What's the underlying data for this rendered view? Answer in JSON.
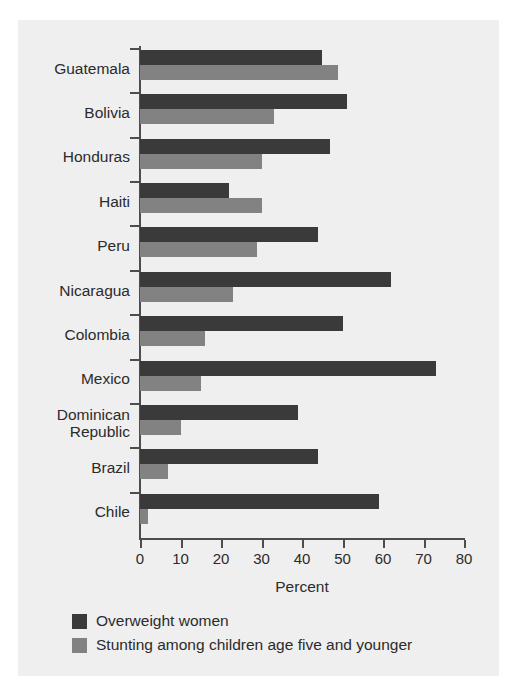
{
  "chart_data": {
    "type": "bar",
    "orientation": "horizontal",
    "title": "",
    "xlabel": "Percent",
    "ylabel": "",
    "xlim": [
      0,
      80
    ],
    "xticks": [
      0,
      10,
      20,
      30,
      40,
      50,
      60,
      70,
      80
    ],
    "grid": false,
    "legend_position": "bottom-left",
    "categories": [
      "Guatemala",
      "Bolivia",
      "Honduras",
      "Haiti",
      "Peru",
      "Nicaragua",
      "Colombia",
      "Mexico",
      "Dominican\nRepublic",
      "Brazil",
      "Chile"
    ],
    "category_labels": [
      "Guatemala",
      "Bolivia",
      "Honduras",
      "Haiti",
      "Peru",
      "Nicaragua",
      "Colombia",
      "Mexico",
      "Dominican Republic",
      "Brazil",
      "Chile"
    ],
    "series": [
      {
        "name": "Overweight women",
        "color": "#3a3a3a",
        "values": [
          45,
          51,
          47,
          22,
          44,
          62,
          50,
          73,
          39,
          44,
          59
        ]
      },
      {
        "name": "Stunting among children age five and younger",
        "color": "#828282",
        "values": [
          49,
          33,
          30,
          30,
          29,
          23,
          16,
          15,
          10,
          7,
          2
        ]
      }
    ]
  },
  "axis": {
    "x_title": "Percent",
    "tick_labels": [
      "0",
      "10",
      "20",
      "30",
      "40",
      "50",
      "60",
      "70",
      "80"
    ]
  },
  "legend": {
    "items": [
      {
        "label": "Overweight women",
        "color": "#3a3a3a"
      },
      {
        "label": "Stunting among children age five and younger",
        "color": "#828282"
      }
    ]
  },
  "colors": {
    "series_dark": "#3a3a3a",
    "series_light": "#828282",
    "panel_background": "#efefef",
    "axis": "#4d4d4d",
    "text": "#2b2b2b"
  }
}
